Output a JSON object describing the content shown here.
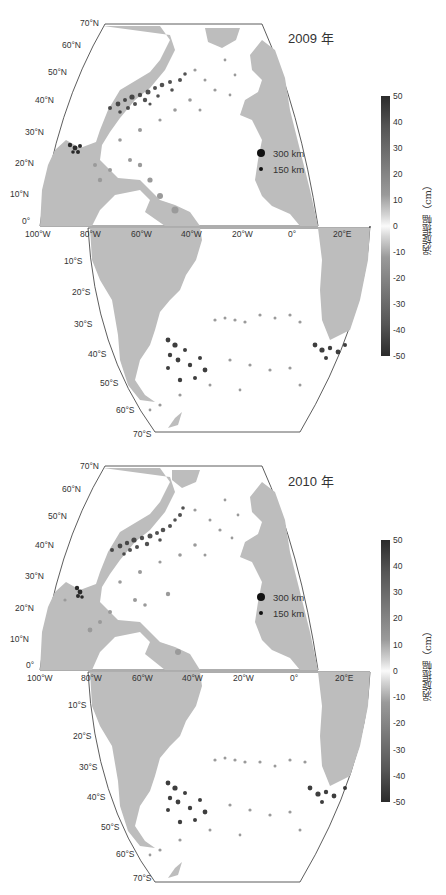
{
  "figure": {
    "panels": [
      {
        "year_label": "2009 年",
        "lat_labels_north": [
          "70°N",
          "60°N",
          "50°N",
          "40°N",
          "30°N",
          "20°N",
          "10°N",
          "0°"
        ],
        "lon_labels": [
          "100°W",
          "80°W",
          "60°W",
          "40°W",
          "20°W",
          "0°",
          "20°E"
        ],
        "lat_labels_south": [
          "10°S",
          "20°S",
          "30°S",
          "40°S",
          "50°S",
          "60°S",
          "70°S"
        ],
        "legend": [
          {
            "size_label": "300 km"
          },
          {
            "size_label": "150 km"
          }
        ],
        "colorbar": {
          "ticks": [
            "50",
            "40",
            "30",
            "20",
            "10",
            "0",
            "-10",
            "-20",
            "-30",
            "-40",
            "-50"
          ],
          "label": "涡旋振幅（cm）"
        }
      },
      {
        "year_label": "2010 年",
        "lat_labels_north": [
          "70°N",
          "60°N",
          "50°N",
          "40°N",
          "30°N",
          "20°N",
          "10°N",
          "0°"
        ],
        "lon_labels": [
          "100°W",
          "80°W",
          "60°W",
          "40°W",
          "20°W",
          "0°",
          "20°E"
        ],
        "lat_labels_south": [
          "10°S",
          "20°S",
          "30°S",
          "40°S",
          "50°S",
          "60°S",
          "70°S"
        ],
        "legend": [
          {
            "size_label": "300 km"
          },
          {
            "size_label": "150 km"
          }
        ],
        "colorbar": {
          "ticks": [
            "50",
            "40",
            "30",
            "20",
            "10",
            "0",
            "-10",
            "-20",
            "-30",
            "-40",
            "-50"
          ],
          "label": "涡旋振幅（cm）"
        }
      }
    ],
    "colors": {
      "land": "#bdbdbd",
      "ocean": "#ffffff",
      "frame": "#333333",
      "eddy_strong": "#222222",
      "eddy_weak": "#9a9a9a"
    }
  }
}
